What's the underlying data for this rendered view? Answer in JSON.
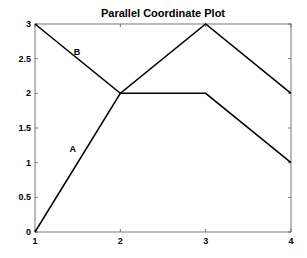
{
  "chart_data": {
    "type": "line",
    "title": "Parallel Coordinate Plot",
    "xlabel": "",
    "ylabel": "",
    "x": [
      1,
      2,
      3,
      4
    ],
    "xlim": [
      1,
      4
    ],
    "ylim": [
      0,
      3
    ],
    "xticks": [
      "1",
      "2",
      "3",
      "4"
    ],
    "yticks": [
      "0",
      "0.5",
      "1",
      "1.5",
      "2",
      "2.5",
      "3"
    ],
    "grid": false,
    "series": [
      {
        "name": "A",
        "values": [
          0,
          2,
          2,
          1
        ]
      },
      {
        "name": "B",
        "values": [
          3,
          2,
          3,
          2
        ]
      }
    ],
    "annotations": [
      {
        "text": "A",
        "x": 1.45,
        "y": 1.2
      },
      {
        "text": "B",
        "x": 1.5,
        "y": 2.6
      }
    ],
    "line_color": "#000000"
  }
}
